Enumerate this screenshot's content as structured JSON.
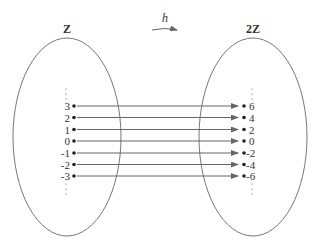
{
  "diagram": {
    "domain_set": {
      "label": "Z",
      "elements": [
        "3",
        "2",
        "1",
        "0",
        "-1",
        "-2",
        "-3"
      ]
    },
    "codomain_set": {
      "label": "2Z",
      "elements": [
        "6",
        "4",
        "2",
        "0",
        "-2",
        "-4",
        "-6"
      ]
    },
    "function": {
      "label": "h"
    },
    "ellipsis": "⋮",
    "colors": {
      "stroke": "#777777",
      "arrow": "#666666",
      "text": "#333333"
    }
  }
}
